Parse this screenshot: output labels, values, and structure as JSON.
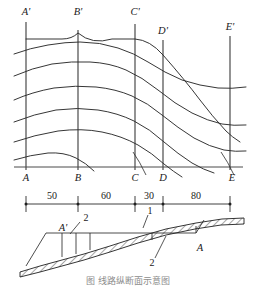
{
  "figure": {
    "title_caption": "图  线路纵断面示意图",
    "top_panel": {
      "name": "contour-profile-panel",
      "station_labels_top": [
        {
          "id": "A-prime",
          "text": "A'",
          "x": 26
        },
        {
          "id": "B-prime",
          "text": "B'",
          "x": 78
        },
        {
          "id": "C-prime",
          "text": "C'",
          "x": 135
        },
        {
          "id": "D-prime",
          "text": "D'",
          "x": 163
        },
        {
          "id": "E-prime",
          "text": "E'",
          "x": 230
        }
      ],
      "station_labels_bottom": [
        {
          "id": "A",
          "text": "A",
          "x": 26
        },
        {
          "id": "B",
          "text": "B",
          "x": 78
        },
        {
          "id": "C",
          "text": "C",
          "x": 135
        },
        {
          "id": "D",
          "text": "D",
          "x": 163
        },
        {
          "id": "E",
          "text": "E",
          "x": 230
        }
      ],
      "contour_count": 7
    },
    "dimension_strip": {
      "name": "dimension-chain",
      "segments": [
        {
          "label": "50",
          "from": "A",
          "to": "B"
        },
        {
          "label": "60",
          "from": "B",
          "to": "C"
        },
        {
          "label": "30",
          "from": "C",
          "to": "D"
        },
        {
          "label": "80",
          "from": "D",
          "to": "E"
        }
      ]
    },
    "cross_section": {
      "name": "embankment-cross-section",
      "callouts": [
        {
          "id": "section-a-prime",
          "text": "A'"
        },
        {
          "id": "layer-2-left",
          "text": "2"
        },
        {
          "id": "layer-1-top",
          "text": "1"
        },
        {
          "id": "layer-2-right",
          "text": "2"
        },
        {
          "id": "section-a",
          "text": "A"
        }
      ]
    }
  }
}
